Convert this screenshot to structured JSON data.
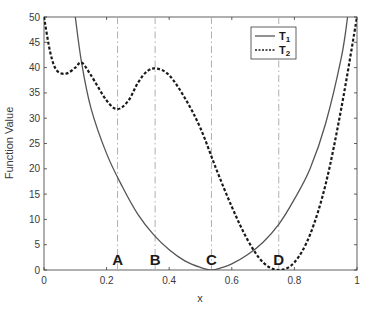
{
  "chart_data": {
    "type": "line",
    "title": "",
    "xlabel": "x",
    "ylabel": "Function Value",
    "xlim": [
      0,
      1
    ],
    "ylim": [
      0,
      50
    ],
    "xticks": [
      "0",
      "0.2",
      "0.4",
      "0.6",
      "0.8",
      "1"
    ],
    "yticks": [
      "0",
      "5",
      "10",
      "15",
      "20",
      "25",
      "30",
      "35",
      "40",
      "45",
      "50"
    ],
    "grid": false,
    "legend": {
      "position": "upper right",
      "entries": [
        "T1",
        "T2"
      ]
    },
    "series": [
      {
        "name": "T1",
        "style": "solid",
        "color": "#555555",
        "x": [
          0.1,
          0.12,
          0.15,
          0.2,
          0.25,
          0.3,
          0.35,
          0.4,
          0.45,
          0.5,
          0.535,
          0.57,
          0.6,
          0.65,
          0.7,
          0.75,
          0.8,
          0.85,
          0.9,
          0.95,
          0.97
        ],
        "y": [
          50,
          41,
          32,
          23,
          16.5,
          11,
          7,
          4,
          1.8,
          0.5,
          0,
          0.5,
          1.2,
          3,
          5.5,
          9,
          14,
          20,
          29,
          42,
          50
        ]
      },
      {
        "name": "T2",
        "style": "dashed",
        "color": "#1a1a1a",
        "x": [
          0.0,
          0.02,
          0.04,
          0.07,
          0.1,
          0.12,
          0.15,
          0.2,
          0.235,
          0.27,
          0.3,
          0.33,
          0.36,
          0.4,
          0.45,
          0.5,
          0.55,
          0.6,
          0.65,
          0.7,
          0.75,
          0.8,
          0.85,
          0.9,
          0.95,
          1.0
        ],
        "y": [
          50,
          43,
          39.5,
          38.8,
          40,
          41,
          38.5,
          33.5,
          31.8,
          33.5,
          37,
          39.3,
          39.8,
          38.5,
          34,
          28,
          20,
          12.5,
          6,
          1.5,
          0,
          1.5,
          7,
          17,
          32,
          50
        ]
      }
    ],
    "vertical_markers": [
      {
        "label": "A",
        "x": 0.235
      },
      {
        "label": "B",
        "x": 0.355
      },
      {
        "label": "C",
        "x": 0.535
      },
      {
        "label": "D",
        "x": 0.75
      }
    ]
  }
}
